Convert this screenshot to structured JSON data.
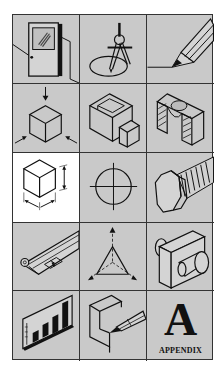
{
  "grid": {
    "rows": 5,
    "columns": 3,
    "background_color": "#c9c9c9",
    "highlight_color": "#ffffff",
    "line_color": "#222222",
    "cells": [
      {
        "row": 1,
        "col": 1,
        "icon": "door-icon",
        "highlighted": false
      },
      {
        "row": 1,
        "col": 2,
        "icon": "compass-drawing-icon",
        "highlighted": false
      },
      {
        "row": 1,
        "col": 3,
        "icon": "pencil-icon",
        "highlighted": false
      },
      {
        "row": 2,
        "col": 1,
        "icon": "isometric-cube-views-icon",
        "highlighted": false
      },
      {
        "row": 2,
        "col": 2,
        "icon": "hollow-block-icon",
        "highlighted": false
      },
      {
        "row": 2,
        "col": 3,
        "icon": "section-view-icon",
        "highlighted": false
      },
      {
        "row": 3,
        "col": 1,
        "icon": "cube-dimensions-icon",
        "highlighted": true
      },
      {
        "row": 3,
        "col": 2,
        "icon": "circle-centerline-icon",
        "highlighted": false
      },
      {
        "row": 3,
        "col": 3,
        "icon": "hex-bolt-icon",
        "highlighted": false
      },
      {
        "row": 4,
        "col": 1,
        "icon": "blueprint-scroll-icon",
        "highlighted": false
      },
      {
        "row": 4,
        "col": 2,
        "icon": "isometric-axes-icon",
        "highlighted": false
      },
      {
        "row": 4,
        "col": 3,
        "icon": "block-with-cylinder-icon",
        "highlighted": false
      },
      {
        "row": 5,
        "col": 1,
        "icon": "bar-chart-board-icon",
        "highlighted": false
      },
      {
        "row": 5,
        "col": 2,
        "icon": "pencil-on-block-icon",
        "highlighted": false
      },
      {
        "row": 5,
        "col": 3,
        "icon": "appendix-icon",
        "highlighted": false
      }
    ]
  },
  "appendix": {
    "letter": "A",
    "label": "APPENDIX"
  }
}
